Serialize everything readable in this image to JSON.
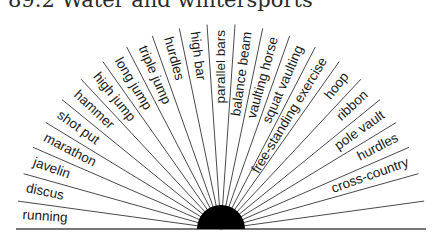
{
  "title": "89.2 Water and wintersports",
  "diagram": {
    "center": {
      "x": 221,
      "y": 229
    },
    "hub_radius": 24,
    "ray_length": 205,
    "line_color": "#4a4a4a",
    "hub_color": "#000000",
    "sectors": [
      "running",
      "discus",
      "javelin",
      "marathon",
      "shot put",
      "hammer",
      "high jump",
      "long jump",
      "triple jump",
      "hurdles",
      "high bar",
      "parallel bars",
      "balance beam",
      "vaulting horse",
      "squat vaulting",
      "free-standing exercise",
      "hoop",
      "ribbon",
      "pole vault",
      "hurdles",
      "cross-country",
      "",
      ""
    ]
  }
}
